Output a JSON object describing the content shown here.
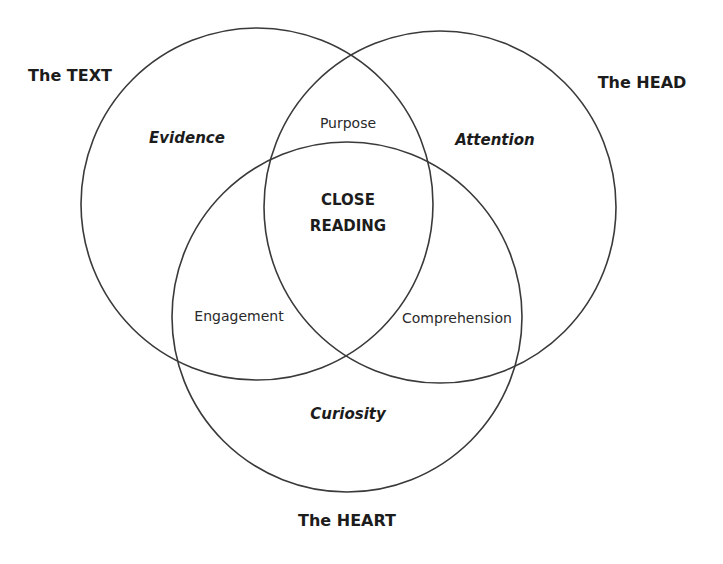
{
  "diagram": {
    "type": "venn",
    "sets": [
      {
        "id": "text",
        "label": "The TEXT",
        "trait": "Evidence"
      },
      {
        "id": "head",
        "label": "The HEAD",
        "trait": "Attention"
      },
      {
        "id": "heart",
        "label": "The HEART",
        "trait": "Curiosity"
      }
    ],
    "intersections": {
      "text_head": "Purpose",
      "text_heart": "Engagement",
      "head_heart": "Comprehension",
      "all": [
        "CLOSE",
        "READING"
      ]
    },
    "colors": {
      "stroke": "#3a3a3a",
      "text": "#1c1c1c",
      "background": "#ffffff"
    }
  }
}
